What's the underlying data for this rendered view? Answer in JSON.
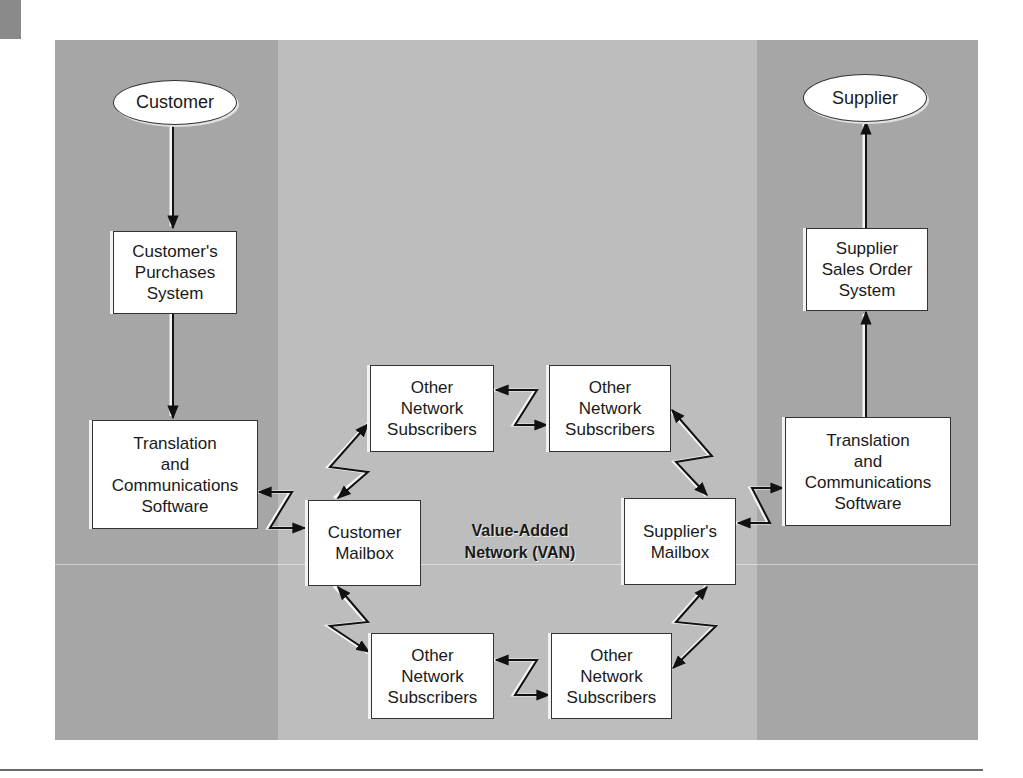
{
  "diagram": {
    "title": "Value-Added Network (VAN)",
    "endpoints": {
      "customer": "Customer",
      "supplier": "Supplier"
    },
    "boxes": {
      "customer_purchases": "Customer's\nPurchases\nSystem",
      "customer_translation": "Translation\nand\nCommunications\nSoftware",
      "customer_mailbox": "Customer\nMailbox",
      "supplier_mailbox": "Supplier's\nMailbox",
      "supplier_translation": "Translation\nand\nCommunications\nSoftware",
      "supplier_sales_order": "Supplier\nSales Order\nSystem",
      "other_top_left": "Other\nNetwork\nSubscribers",
      "other_top_right": "Other\nNetwork\nSubscribers",
      "other_bottom_left": "Other\nNetwork\nSubscribers",
      "other_bottom_right": "Other\nNetwork\nSubscribers"
    },
    "colors": {
      "outer_columns": "#a6a6a6",
      "center_column": "#bdbdbd",
      "box_fill": "#ffffff",
      "stroke": "#1a1a1a"
    },
    "flows": [
      {
        "from": "Customer",
        "to": "Customer's Purchases System",
        "type": "one-way"
      },
      {
        "from": "Customer's Purchases System",
        "to": "Translation and Communications Software (customer)",
        "type": "one-way"
      },
      {
        "from": "Translation and Communications Software (customer)",
        "to": "Customer Mailbox",
        "type": "two-way"
      },
      {
        "from": "Customer Mailbox",
        "to": "Other Network Subscribers (top-left)",
        "type": "two-way"
      },
      {
        "from": "Other Network Subscribers (top-left)",
        "to": "Other Network Subscribers (top-right)",
        "type": "two-way"
      },
      {
        "from": "Other Network Subscribers (top-right)",
        "to": "Supplier's Mailbox",
        "type": "two-way"
      },
      {
        "from": "Customer Mailbox",
        "to": "Other Network Subscribers (bottom-left)",
        "type": "two-way"
      },
      {
        "from": "Other Network Subscribers (bottom-left)",
        "to": "Other Network Subscribers (bottom-right)",
        "type": "two-way"
      },
      {
        "from": "Other Network Subscribers (bottom-right)",
        "to": "Supplier's Mailbox",
        "type": "two-way"
      },
      {
        "from": "Supplier's Mailbox",
        "to": "Translation and Communications Software (supplier)",
        "type": "two-way"
      },
      {
        "from": "Translation and Communications Software (supplier)",
        "to": "Supplier Sales Order System",
        "type": "one-way"
      },
      {
        "from": "Supplier Sales Order System",
        "to": "Supplier",
        "type": "one-way"
      }
    ]
  }
}
